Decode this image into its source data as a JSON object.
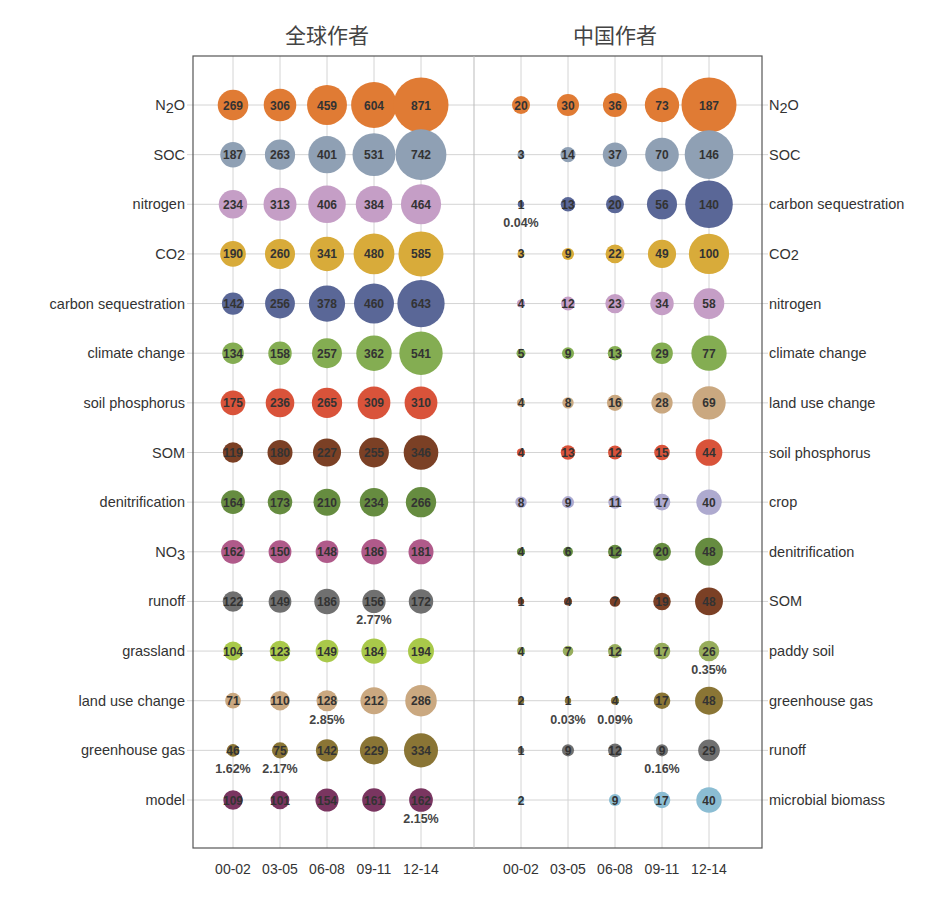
{
  "chart_data": [
    {
      "type": "bubble",
      "title": "全球作者",
      "categories": [
        "00-02",
        "03-05",
        "06-08",
        "09-11",
        "12-14"
      ],
      "rows": [
        {
          "label": "N2O",
          "label_html": [
            "N",
            "2",
            "O"
          ],
          "color": "#e07b34",
          "values": [
            269,
            306,
            459,
            604,
            871
          ]
        },
        {
          "label": "SOC",
          "color": "#8fa0b4",
          "values": [
            187,
            263,
            401,
            531,
            742
          ]
        },
        {
          "label": "nitrogen",
          "color": "#c59ec6",
          "values": [
            234,
            313,
            406,
            384,
            464
          ]
        },
        {
          "label": "CO2",
          "label_html": [
            "CO",
            "2",
            ""
          ],
          "sub_inline": true,
          "color": "#d8ab3a",
          "values": [
            190,
            260,
            341,
            480,
            585
          ]
        },
        {
          "label": "carbon sequestration",
          "color": "#5a6797",
          "values": [
            142,
            256,
            378,
            460,
            643
          ]
        },
        {
          "label": "climate change",
          "color": "#84ad52",
          "values": [
            134,
            158,
            257,
            362,
            541
          ]
        },
        {
          "label": "soil phosphorus",
          "color": "#d9533a",
          "values": [
            175,
            236,
            265,
            309,
            310
          ]
        },
        {
          "label": "SOM",
          "color": "#7b4025",
          "values": [
            119,
            180,
            227,
            255,
            346
          ]
        },
        {
          "label": "denitrification",
          "color": "#668c40",
          "values": [
            164,
            173,
            210,
            234,
            266
          ]
        },
        {
          "label": "NO3",
          "label_html": [
            "NO",
            "3",
            ""
          ],
          "color": "#b05a8a",
          "values": [
            162,
            150,
            148,
            186,
            181
          ]
        },
        {
          "label": "runoff",
          "color": "#707070",
          "values": [
            122,
            149,
            186,
            156,
            172
          ]
        },
        {
          "label": "grassland",
          "color": "#a9c94a",
          "values": [
            104,
            123,
            149,
            184,
            194
          ]
        },
        {
          "label": "land use change",
          "color": "#caa880",
          "values": [
            71,
            110,
            128,
            212,
            286
          ]
        },
        {
          "label": "greenhouse gas",
          "color": "#8a7535",
          "values": [
            46,
            75,
            142,
            229,
            334
          ]
        },
        {
          "label": "model",
          "color": "#7a3560",
          "values": [
            109,
            101,
            154,
            161,
            162
          ]
        }
      ],
      "annotations": [
        {
          "row": 10,
          "col": 3,
          "text": "2.77%"
        },
        {
          "row": 12,
          "col": 2,
          "text": "2.85%"
        },
        {
          "row": 13,
          "col": 0,
          "text": "1.62%"
        },
        {
          "row": 13,
          "col": 1,
          "text": "2.17%"
        },
        {
          "row": 14,
          "col": 4,
          "text": "2.15%"
        }
      ],
      "grid": true
    },
    {
      "type": "bubble",
      "title": "中国作者",
      "categories": [
        "00-02",
        "03-05",
        "06-08",
        "09-11",
        "12-14"
      ],
      "rows": [
        {
          "label": "N2O",
          "label_html": [
            "N",
            "2",
            "O"
          ],
          "color": "#e07b34",
          "values": [
            20,
            30,
            36,
            73,
            187
          ]
        },
        {
          "label": "SOC",
          "color": "#8fa0b4",
          "values": [
            3,
            14,
            37,
            70,
            146
          ]
        },
        {
          "label": "carbon sequestration",
          "color": "#5a6797",
          "values": [
            1,
            13,
            20,
            56,
            140
          ]
        },
        {
          "label": "CO2",
          "label_html": [
            "CO",
            "2",
            ""
          ],
          "sub_inline": true,
          "color": "#d8ab3a",
          "values": [
            3,
            9,
            22,
            49,
            100
          ]
        },
        {
          "label": "nitrogen",
          "color": "#c59ec6",
          "values": [
            4,
            12,
            23,
            34,
            58
          ]
        },
        {
          "label": "climate change",
          "color": "#84ad52",
          "values": [
            5,
            9,
            13,
            29,
            77
          ]
        },
        {
          "label": "land use change",
          "color": "#caa880",
          "values": [
            4,
            8,
            16,
            28,
            69
          ]
        },
        {
          "label": "soil phosphorus",
          "color": "#d9533a",
          "values": [
            4,
            13,
            12,
            15,
            44
          ]
        },
        {
          "label": "crop",
          "color": "#aeaacf",
          "values": [
            8,
            9,
            11,
            17,
            40
          ]
        },
        {
          "label": "denitrification",
          "color": "#668c40",
          "values": [
            4,
            6,
            12,
            20,
            48
          ]
        },
        {
          "label": "SOM",
          "color": "#7b4025",
          "values": [
            1,
            4,
            7,
            19,
            48
          ]
        },
        {
          "label": "paddy soil",
          "color": "#97ad5c",
          "values": [
            4,
            7,
            12,
            17,
            26
          ]
        },
        {
          "label": "greenhouse gas",
          "color": "#8a7535",
          "values": [
            2,
            1,
            4,
            17,
            48
          ]
        },
        {
          "label": "runoff",
          "color": "#707070",
          "values": [
            1,
            9,
            12,
            9,
            29
          ]
        },
        {
          "label": "microbial biomass",
          "color": "#8bbdd3",
          "values": [
            2,
            null,
            9,
            17,
            40
          ]
        }
      ],
      "annotations": [
        {
          "row": 2,
          "col": 0,
          "text": "0.04%"
        },
        {
          "row": 11,
          "col": 4,
          "text": "0.35%"
        },
        {
          "row": 12,
          "col": 1,
          "text": "0.03%"
        },
        {
          "row": 12,
          "col": 2,
          "text": "0.09%"
        },
        {
          "row": 13,
          "col": 3,
          "text": "0.16%"
        }
      ],
      "grid": true
    }
  ]
}
